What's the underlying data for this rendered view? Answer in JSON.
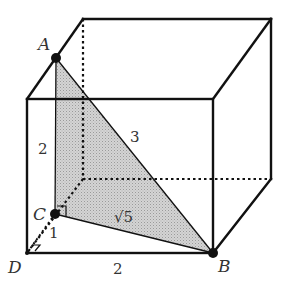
{
  "diagram": {
    "type": "cube-with-triangular-section",
    "vertices": {
      "A": {
        "label": "A"
      },
      "B": {
        "label": "B"
      },
      "C": {
        "label": "C"
      },
      "D": {
        "label": "D"
      }
    },
    "edge_labels": {
      "AC": "2",
      "AB": "3",
      "CB": "√5",
      "CD": "1",
      "DB": "2"
    },
    "colors": {
      "lines": "#111111",
      "shade": "#c8c8c8",
      "points": "#111111"
    }
  }
}
